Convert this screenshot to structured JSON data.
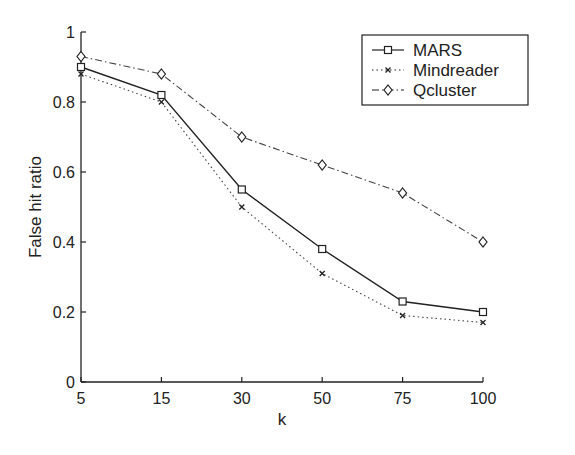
{
  "chart_data": {
    "type": "line",
    "title": "",
    "xlabel": "k",
    "ylabel": "False hit ratio",
    "categories": [
      "5",
      "15",
      "30",
      "50",
      "75",
      "100"
    ],
    "ylim": [
      0,
      1
    ],
    "yticks": [
      "0",
      "0.2",
      "0.4",
      "0.6",
      "0.8",
      "1"
    ],
    "grid": false,
    "legend_position": "upper right",
    "series": [
      {
        "name": "MARS",
        "style": "solid",
        "marker": "square",
        "values": [
          0.9,
          0.82,
          0.55,
          0.38,
          0.23,
          0.2
        ]
      },
      {
        "name": "Mindreader",
        "style": "dotted",
        "marker": "x",
        "values": [
          0.88,
          0.8,
          0.5,
          0.31,
          0.19,
          0.17
        ]
      },
      {
        "name": "Qcluster",
        "style": "dashdot",
        "marker": "diamond",
        "values": [
          0.93,
          0.88,
          0.7,
          0.62,
          0.54,
          0.4
        ]
      }
    ]
  }
}
